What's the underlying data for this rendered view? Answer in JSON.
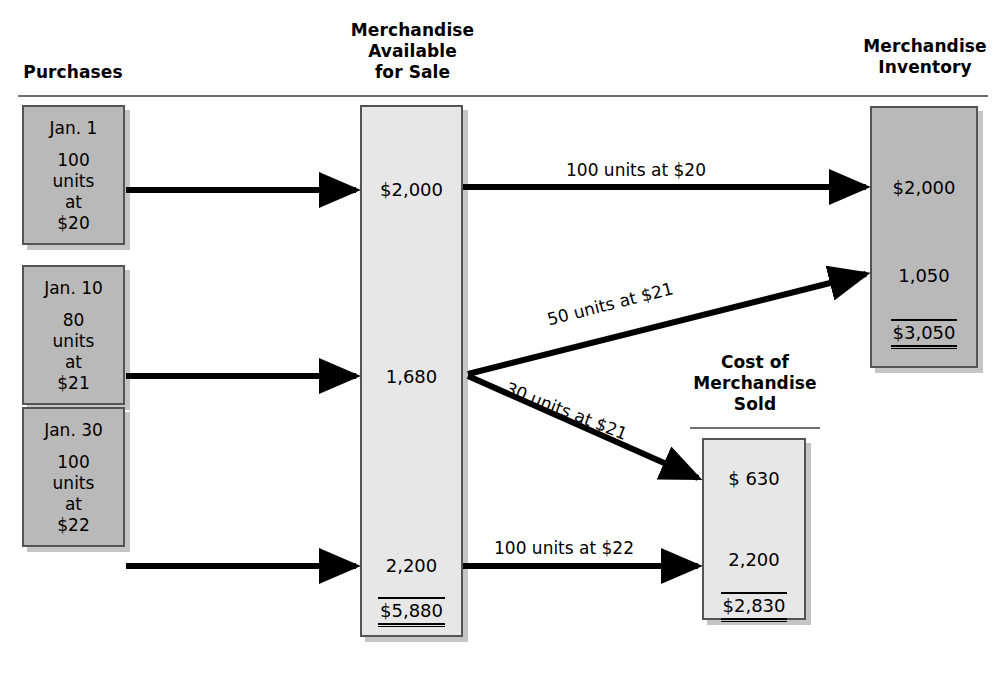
{
  "figure": {
    "type": "flow-diagram",
    "title_columns": [
      "Purchases",
      "Merchandise Available for Sale",
      "Cost of Merchandise Sold",
      "Merchandise Inventory"
    ]
  },
  "headings": {
    "purchases": "Purchases",
    "available": "Merchandise\nAvailable\nfor Sale",
    "cost_of_merch_sold": "Cost of\nMerchandise\nSold",
    "inventory": "Merchandise\nInventory"
  },
  "purchases": [
    {
      "date": "Jan. 1",
      "detail": "100\nunits\nat\n$20",
      "units": 100,
      "unit_cost": 20,
      "amount": 2000
    },
    {
      "date": "Jan. 10",
      "detail": "80\nunits\nat\n$21",
      "units": 80,
      "unit_cost": 21,
      "amount": 1680
    },
    {
      "date": "Jan. 30",
      "detail": "100\nunits\nat\n$22",
      "units": 100,
      "unit_cost": 22,
      "amount": 2200
    }
  ],
  "available_for_sale": {
    "lines": [
      "$2,000",
      "1,680",
      "2,200"
    ],
    "total": "$5,880"
  },
  "cost_of_merchandise_sold": {
    "lines": [
      "$   630",
      "2,200"
    ],
    "total": "$2,830"
  },
  "merchandise_inventory": {
    "lines": [
      "$2,000",
      "1,050"
    ],
    "total": "$3,050"
  },
  "flow_labels": {
    "to_inventory_20": "100 units at $20",
    "to_inventory_21": "50 units at $21",
    "to_cogs_21": "30 units at $21",
    "to_cogs_22": "100 units at $22"
  },
  "colors": {
    "box_dark": "#b9b9b9",
    "box_light": "#e7e7e7",
    "border": "#545454",
    "rule": "#6f6f6f",
    "arrow": "#000000"
  }
}
